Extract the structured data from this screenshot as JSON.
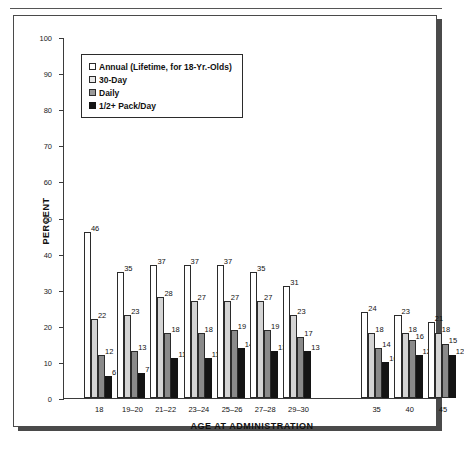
{
  "chart_data": {
    "type": "bar",
    "title": "",
    "xlabel": "AGE AT ADMINISTRATION",
    "ylabel": "PERCENT",
    "ylim": [
      0,
      100
    ],
    "ytick_step": 10,
    "yticks": [
      0,
      10,
      20,
      30,
      40,
      50,
      60,
      70,
      80,
      90,
      100
    ],
    "grid": false,
    "legend_position": "upper-left-inside",
    "categories": [
      "18",
      "19–20",
      "21–22",
      "23–24",
      "25–26",
      "27–28",
      "29–30",
      "35",
      "40",
      "45"
    ],
    "series": [
      {
        "name": "Annual (Lifetime, for 18-Yr.-Olds)",
        "color": "#ffffff",
        "values": [
          46,
          35,
          37,
          37,
          37,
          35,
          31,
          24,
          23,
          21
        ]
      },
      {
        "name": "30-Day",
        "color": "#d4d4d4",
        "values": [
          22,
          23,
          28,
          27,
          27,
          27,
          23,
          18,
          18,
          18
        ]
      },
      {
        "name": "Daily",
        "color": "#8a8a8a",
        "values": [
          12,
          13,
          18,
          18,
          19,
          19,
          17,
          14,
          16,
          15
        ]
      },
      {
        "name": "1/2+ Pack/Day",
        "color": "#141414",
        "values": [
          6,
          7,
          11,
          11,
          14,
          13,
          13,
          10,
          12,
          12
        ]
      }
    ],
    "category_gap_after": "29–30"
  },
  "legend": {
    "items": [
      {
        "label": "Annual (Lifetime, for 18-Yr.-Olds)",
        "swatch": "white"
      },
      {
        "label": "30-Day",
        "swatch": "light-gray"
      },
      {
        "label": "Daily",
        "swatch": "medium-gray"
      },
      {
        "label": "1/2+ Pack/Day",
        "swatch": "black"
      }
    ]
  },
  "axes": {
    "y_title": "PERCENT",
    "x_title": "AGE AT ADMINISTRATION",
    "y_tick_labels": [
      "100",
      "90",
      "80",
      "70",
      "60",
      "50",
      "40",
      "30",
      "20",
      "10",
      "0"
    ]
  }
}
